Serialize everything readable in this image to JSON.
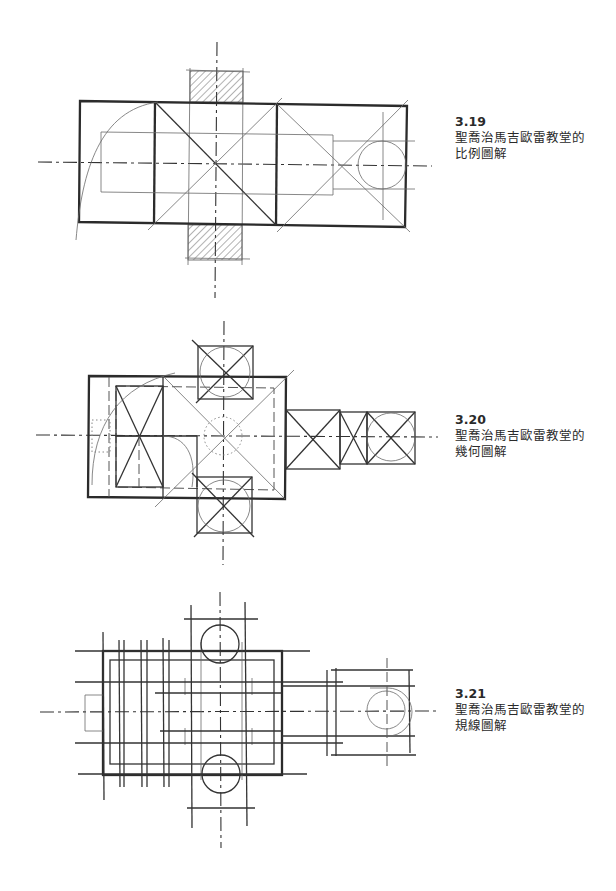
{
  "figures": [
    {
      "id": "3.19",
      "number": "3.19",
      "title_line1": "聖喬治馬吉歐雷教堂的",
      "title_line2": "比例圖解",
      "drawing": "proportion-diagram-plan"
    },
    {
      "id": "3.20",
      "number": "3.20",
      "title_line1": "聖喬治馬吉歐雷教堂的",
      "title_line2": "幾何圖解",
      "drawing": "geometry-diagram-plan"
    },
    {
      "id": "3.21",
      "number": "3.21",
      "title_line1": "聖喬治馬吉歐雷教堂的",
      "title_line2": "規線圖解",
      "drawing": "regulating-lines-diagram-plan"
    }
  ],
  "colors": {
    "ink": "#2b2b2b",
    "light_ink": "#6a6a6a",
    "background": "#ffffff"
  }
}
